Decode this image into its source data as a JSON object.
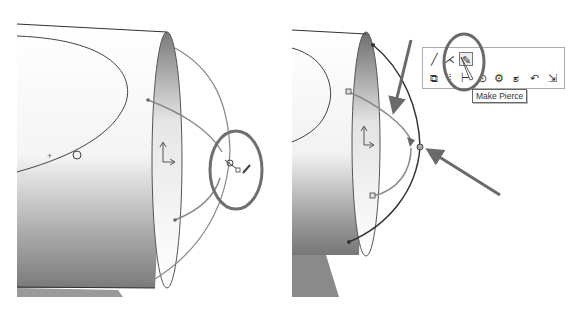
{
  "left_view": {
    "description": "3D sketch on cylinder end with pierce relation candidate",
    "highlight_circle_color": "#707070"
  },
  "right_view": {
    "toolbar": {
      "row1": [
        {
          "icon": "line-icon",
          "glyph": "╱"
        },
        {
          "icon": "sketch-angle-icon",
          "glyph": "⋌"
        },
        {
          "icon": "make-pierce-icon",
          "glyph": "✎",
          "selected": true
        }
      ],
      "row2": [
        {
          "icon": "copy-entities-icon",
          "glyph": "⧉"
        },
        {
          "icon": "mirror-icon",
          "glyph": "⁞"
        },
        {
          "icon": "dimension-icon",
          "glyph": "⊢"
        },
        {
          "icon": "relations-icon",
          "glyph": "⊙"
        },
        {
          "icon": "repair-icon",
          "glyph": "⚙"
        },
        {
          "icon": "convert-icon",
          "glyph": "ಶ"
        },
        {
          "icon": "undo-icon",
          "glyph": "↶"
        },
        {
          "icon": "exit-sketch-icon",
          "glyph": "⇲"
        }
      ]
    },
    "tooltip": "Make Pierce",
    "arrow_color": "#6a6a6a"
  }
}
